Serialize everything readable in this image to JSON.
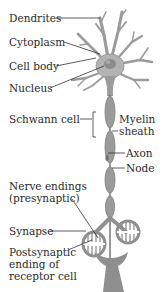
{
  "diagram": {
    "type": "neuron-anatomy",
    "colors": {
      "neuron": "#9b9b9b",
      "neuron_dark": "#7d7d7d",
      "soma": "#b3b3b3",
      "nucleus": "#8c8c8c",
      "leader_line": "#333333",
      "text": "#2a2a2a"
    },
    "labels": {
      "dendrites": "Dendrites",
      "cytoplasm": "Cytoplasm",
      "cell_body": "Cell body",
      "nucleus": "Nucleus",
      "schwann_cell": "Schwann cell",
      "myelin_line1": "Myelin",
      "myelin_line2": "sheath",
      "axon": "Axon",
      "node": "Node",
      "nerve_endings_line1": "Nerve endings",
      "nerve_endings_line2": "(presynaptic)",
      "synapse": "Synapse",
      "postsynaptic_line1": "Postsynaptic",
      "postsynaptic_line2": "ending of",
      "postsynaptic_line3": "receptor cell"
    }
  }
}
